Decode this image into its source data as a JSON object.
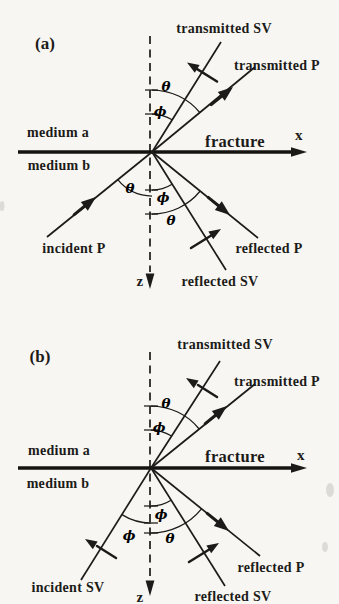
{
  "figure": {
    "background": "#f7f6f2",
    "ink": "#1c1b19",
    "panels": [
      {
        "tag": "(a)",
        "media": {
          "a": "medium a",
          "b": "medium b"
        },
        "interface": {
          "name": "fracture",
          "x_axis": "x",
          "z_axis": "z"
        },
        "angles": {
          "theta": "θ",
          "phi": "ϕ"
        },
        "waves": {
          "transmitted_sv": "transmitted SV",
          "transmitted_p": "transmitted P",
          "incident": "incident P",
          "reflected_p": "reflected P",
          "reflected_sv": "reflected SV"
        }
      },
      {
        "tag": "(b)",
        "media": {
          "a": "medium a",
          "b": "medium b"
        },
        "interface": {
          "name": "fracture",
          "x_axis": "x",
          "z_axis": "z"
        },
        "angles": {
          "theta": "θ",
          "phi": "ϕ"
        },
        "waves": {
          "transmitted_sv": "transmitted SV",
          "transmitted_p": "transmitted P",
          "incident": "incident SV",
          "reflected_p": "reflected P",
          "reflected_sv": "reflected SV"
        }
      }
    ]
  }
}
